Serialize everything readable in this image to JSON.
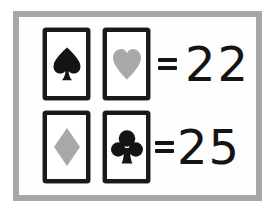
{
  "puzzle": {
    "title": "Card suit value puzzle",
    "frame_color": "#a7a7a7",
    "background_color": "#fdfdfd",
    "ink_color": "#141414",
    "gray_suit_color": "#a8a8a8",
    "black_suit_color": "#141414",
    "equals_symbol": "=",
    "rows": [
      {
        "id": "row-1",
        "cards": [
          {
            "suit": "spade",
            "suit_label": "Spade",
            "color": "#141414",
            "glyph": "♠"
          },
          {
            "suit": "heart",
            "suit_label": "Heart",
            "color": "#a8a8a8",
            "glyph": "♥"
          }
        ],
        "equals": "=",
        "result": "22"
      },
      {
        "id": "row-2",
        "cards": [
          {
            "suit": "diamond",
            "suit_label": "Diamond",
            "color": "#a8a8a8",
            "glyph": "♦"
          },
          {
            "suit": "club",
            "suit_label": "Club",
            "color": "#141414",
            "glyph": "♣"
          }
        ],
        "equals": "=",
        "result": "25"
      }
    ]
  }
}
